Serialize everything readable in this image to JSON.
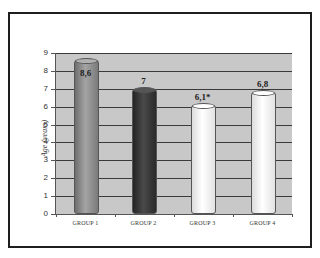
{
  "chart_data": {
    "type": "bar",
    "style": "3d-cylinder",
    "title": "",
    "xlabel": "",
    "ylabel": "Age (years)",
    "categories": [
      "GROUP 1",
      "GROUP 2",
      "GROUP 3",
      "GROUP 4"
    ],
    "values": [
      8.6,
      7,
      6.1,
      6.8
    ],
    "data_labels": [
      "8,6",
      "7",
      "6,1*",
      "6,8"
    ],
    "bar_colors": [
      "#8c8c8c",
      "#3c3c3c",
      "#f4f4f4",
      "#f4f4f4"
    ],
    "ylim": [
      0,
      9
    ],
    "yticks": [
      0,
      1,
      2,
      3,
      4,
      5,
      6,
      7,
      8,
      9
    ],
    "grid": true,
    "plot_background": "#c8c8c8",
    "legend": null,
    "annotations": [
      "* next to GROUP 3 value"
    ]
  }
}
